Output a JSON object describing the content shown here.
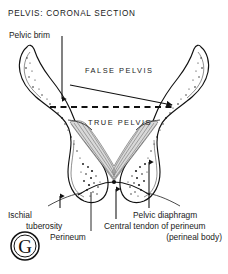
{
  "figure": {
    "title": "PELVIS:  CORONAL SECTION",
    "background_color": "#ffffff",
    "ink_color": "#111111",
    "muscle_color": "#d9d9d9"
  },
  "regions": {
    "false_pelvis": "FALSE  PELVIS",
    "true_pelvis": "TRUE  PELVIS"
  },
  "labels": {
    "pelvic_brim": "Pelvic brim",
    "ischial": "Ischial",
    "tuberosity": "tuberosity",
    "perineum": "Perineum",
    "central_tendon": "Central tendon of perineum",
    "perineal_body": "(perineal body)",
    "pelvic_diaphragm": "Pelvic diaphragm"
  },
  "logo": {
    "letter": "G"
  }
}
